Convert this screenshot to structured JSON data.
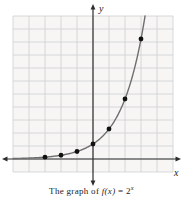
{
  "figure": {
    "caption": {
      "prefix": "The graph of ",
      "function_text": "f(x)",
      "equals_text": " = 2",
      "exponent": "x"
    }
  },
  "chart_data": {
    "type": "line",
    "function": "f(x) = 2^x",
    "xlabel": "x",
    "ylabel": "y",
    "x": [
      -3,
      -2,
      -1,
      0,
      1,
      2,
      3
    ],
    "y": [
      0.125,
      0.25,
      0.5,
      1,
      2,
      4,
      8
    ],
    "series": [
      {
        "name": "f(x) = 2^x",
        "values": [
          0.125,
          0.25,
          0.5,
          1,
          2,
          4,
          8
        ]
      }
    ],
    "xlim": [
      -5,
      5
    ],
    "ylim": [
      -1,
      11
    ],
    "grid": true,
    "legend": false,
    "markers": "filled-dots",
    "colors": {
      "curve": "#6e6e6e",
      "points": "#111111",
      "grid_lines": "#cdd0d2",
      "axes": "#2e2e2e",
      "panel_bg": "#f7f6f4",
      "text": "#1c1c1c"
    }
  }
}
